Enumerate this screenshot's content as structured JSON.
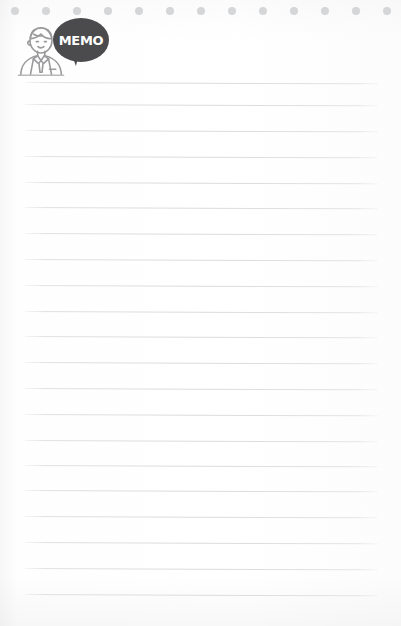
{
  "page": {
    "background_color": "#fdfdfd",
    "width": 401,
    "height": 626
  },
  "header": {
    "bubble_label": "MEMO",
    "bubble_color": "#4b4b4d",
    "bubble_text_color": "#ffffff",
    "person_icon_name": "businessman-line-icon",
    "person_icon_color": "#9a9a9c"
  },
  "dot_strip": {
    "icon_name": "punch-hole-dot",
    "color": "#d5d6d8",
    "count": 13,
    "diameter": 8,
    "start_x": 11,
    "spacing": 31,
    "top": 7
  },
  "rules": {
    "line_color": "#dedfe2",
    "count": 21,
    "first_y": 82,
    "spacing": 25.6,
    "left": 25,
    "right": 378,
    "lines": [
      {
        "y": 82
      },
      {
        "y": 104
      },
      {
        "y": 130
      },
      {
        "y": 156
      },
      {
        "y": 182
      },
      {
        "y": 207
      },
      {
        "y": 233
      },
      {
        "y": 259
      },
      {
        "y": 285
      },
      {
        "y": 311
      },
      {
        "y": 336
      },
      {
        "y": 362
      },
      {
        "y": 388
      },
      {
        "y": 414
      },
      {
        "y": 440
      },
      {
        "y": 465
      },
      {
        "y": 490
      },
      {
        "y": 516
      },
      {
        "y": 542
      },
      {
        "y": 568
      },
      {
        "y": 594
      }
    ]
  },
  "notes": {
    "content": ""
  }
}
